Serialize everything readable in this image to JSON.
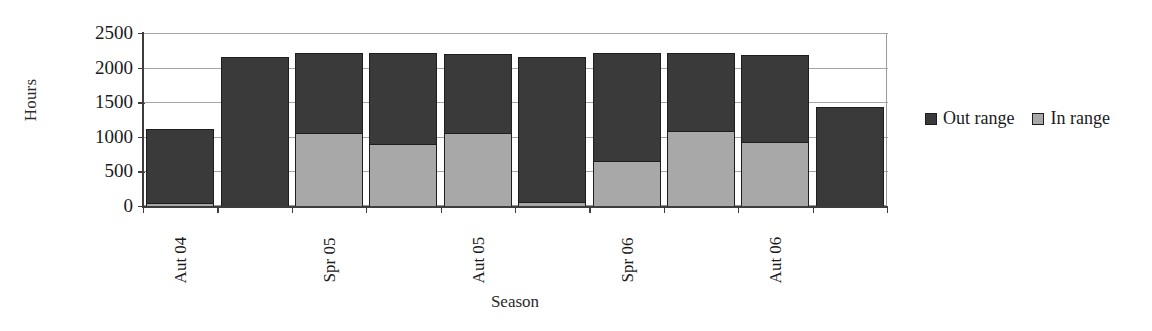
{
  "chart_data": {
    "type": "bar",
    "subtype": "stacked-column",
    "title": "",
    "xlabel": "Season",
    "ylabel": "Hours",
    "ylim": [
      0,
      2500
    ],
    "yticks": [
      0,
      500,
      1000,
      1500,
      2000,
      2500
    ],
    "ytick_labels": [
      "0",
      "500",
      "1000",
      "1500",
      "2000",
      "2500"
    ],
    "grid": true,
    "grid_axis": "y",
    "legend_position": "right",
    "categories": [
      "",
      "Aut 04",
      "",
      "Spr 05",
      "",
      "Aut 05",
      "",
      "Spr 06",
      "",
      "Aut 06"
    ],
    "xtick_labels": [
      "Aut 04",
      "Spr 05",
      "Aut 05",
      "Spr 06",
      "Aut 06"
    ],
    "xtick_label_indices": [
      0,
      2,
      4,
      6,
      8
    ],
    "bar_count": 10,
    "series": [
      {
        "name": "In range",
        "color": "#a8a8a8",
        "values": [
          45,
          0,
          1060,
          900,
          1055,
          60,
          650,
          1090,
          930,
          0
        ]
      },
      {
        "name": "Out range",
        "color": "#3a3a3a",
        "values": [
          1065,
          2160,
          1150,
          1310,
          1135,
          2100,
          1560,
          1120,
          1255,
          1430
        ]
      }
    ],
    "totals": [
      1110,
      2160,
      2210,
      2210,
      2190,
      2160,
      2210,
      2210,
      2185,
      1430
    ]
  },
  "legend": {
    "entries": [
      {
        "label": "Out range",
        "color": "#3a3a3a",
        "swatch": "legend-swatch-out-range"
      },
      {
        "label": "In range",
        "color": "#a8a8a8",
        "swatch": "legend-swatch-in-range"
      }
    ]
  },
  "axes": {
    "y_title": "Hours",
    "x_title": "Season"
  }
}
